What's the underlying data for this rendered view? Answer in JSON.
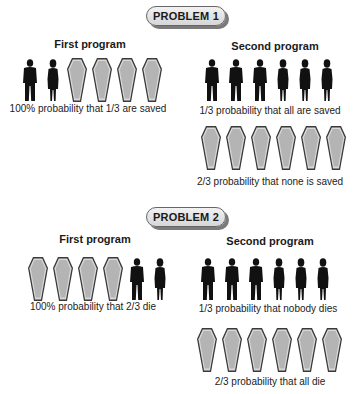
{
  "problems": [
    {
      "label": "PROBLEM 1",
      "first_program": {
        "heading": "First program",
        "icons": [
          "man",
          "woman",
          "coffin",
          "coffin",
          "coffin",
          "coffin"
        ],
        "caption": "100% probability that 1/3 are saved"
      },
      "second_program": {
        "heading": "Second program",
        "outcome_a": {
          "icons": [
            "man",
            "man",
            "man",
            "woman",
            "woman",
            "woman"
          ],
          "caption": "1/3 probability that all are saved"
        },
        "outcome_b": {
          "icons": [
            "coffin",
            "coffin",
            "coffin",
            "coffin",
            "coffin",
            "coffin"
          ],
          "caption": "2/3 probability that none is saved"
        }
      }
    },
    {
      "label": "PROBLEM 2",
      "first_program": {
        "heading": "First program",
        "icons": [
          "coffin",
          "coffin",
          "coffin",
          "coffin",
          "man",
          "woman"
        ],
        "caption": "100% probability that 2/3 die"
      },
      "second_program": {
        "heading": "Second program",
        "outcome_a": {
          "icons": [
            "man",
            "man",
            "man",
            "woman",
            "woman",
            "woman"
          ],
          "caption": "1/3 probability that nobody dies"
        },
        "outcome_b": {
          "icons": [
            "coffin",
            "coffin",
            "coffin",
            "coffin",
            "coffin",
            "coffin"
          ],
          "caption": "2/3 probability that all die"
        }
      }
    }
  ],
  "colors": {
    "silhouette": "#111111",
    "coffin_fill": "#b4b4b4",
    "coffin_edge": "#3a3a3a"
  }
}
